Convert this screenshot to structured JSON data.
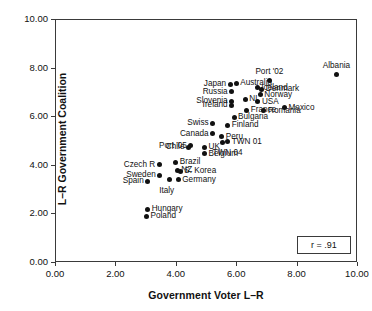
{
  "chart_data": {
    "type": "scatter",
    "title": "",
    "xlabel": "Government Voter L–R",
    "ylabel": "L–R Government Coalition",
    "xlim": [
      0.0,
      10.0
    ],
    "ylim": [
      0.0,
      10.0
    ],
    "xticks": [
      "0.00",
      "2.00",
      "4.00",
      "6.00",
      "8.00",
      "10.00"
    ],
    "yticks": [
      "0.00",
      "2.00",
      "4.00",
      "6.00",
      "8.00",
      "10.00"
    ],
    "xtick_values": [
      0,
      2,
      4,
      6,
      8,
      10
    ],
    "ytick_values": [
      0,
      2,
      4,
      6,
      8,
      10
    ],
    "grid": false,
    "legend": null,
    "annotation": "r = .91",
    "point_color": "#111111",
    "frame_color": "#3a3a3a",
    "points": [
      {
        "label": "Albania",
        "x": 9.33,
        "y": 7.7,
        "label_pos": "above"
      },
      {
        "label": "Port '02",
        "x": 7.1,
        "y": 7.45,
        "label_pos": "above"
      },
      {
        "label": "Japan",
        "x": 5.8,
        "y": 7.32,
        "label_pos": "left"
      },
      {
        "label": "Australia",
        "x": 6.0,
        "y": 7.35,
        "label_pos": "right"
      },
      {
        "label": "Iceland",
        "x": 6.7,
        "y": 7.17,
        "label_pos": "right"
      },
      {
        "label": "Denmark",
        "x": 6.85,
        "y": 7.1,
        "label_pos": "right"
      },
      {
        "label": "Russia",
        "x": 5.85,
        "y": 7.0,
        "label_pos": "left"
      },
      {
        "label": "Norway",
        "x": 6.8,
        "y": 6.88,
        "label_pos": "right"
      },
      {
        "label": "Slovenia",
        "x": 5.85,
        "y": 6.62,
        "label_pos": "left"
      },
      {
        "label": "NL",
        "x": 6.3,
        "y": 6.7,
        "label_pos": "right"
      },
      {
        "label": "USA",
        "x": 6.72,
        "y": 6.6,
        "label_pos": "right"
      },
      {
        "label": "Ireland",
        "x": 5.85,
        "y": 6.45,
        "label_pos": "left"
      },
      {
        "label": "France",
        "x": 6.35,
        "y": 6.25,
        "label_pos": "right"
      },
      {
        "label": "Mexico",
        "x": 7.6,
        "y": 6.35,
        "label_pos": "right"
      },
      {
        "label": "Romania",
        "x": 6.92,
        "y": 6.22,
        "label_pos": "right"
      },
      {
        "label": "Bulgaria",
        "x": 5.93,
        "y": 5.95,
        "label_pos": "right"
      },
      {
        "label": "Swiss",
        "x": 5.22,
        "y": 5.72,
        "label_pos": "left"
      },
      {
        "label": "Finland",
        "x": 5.72,
        "y": 5.62,
        "label_pos": "right"
      },
      {
        "label": "Canada",
        "x": 5.22,
        "y": 5.27,
        "label_pos": "left"
      },
      {
        "label": "Peru",
        "x": 5.52,
        "y": 5.15,
        "label_pos": "right"
      },
      {
        "label": "Port '05",
        "x": 4.5,
        "y": 4.78,
        "label_pos": "left"
      },
      {
        "label": "TWN 01",
        "x": 5.72,
        "y": 4.95,
        "label_pos": "right"
      },
      {
        "label": "TWN 04",
        "x": 5.55,
        "y": 4.93,
        "label_pos": "below"
      },
      {
        "label": "Chile",
        "x": 4.42,
        "y": 4.72,
        "label_pos": "left"
      },
      {
        "label": "UK",
        "x": 4.95,
        "y": 4.72,
        "label_pos": "right"
      },
      {
        "label": "Belgium",
        "x": 4.95,
        "y": 4.45,
        "label_pos": "right"
      },
      {
        "label": "Czech R",
        "x": 3.45,
        "y": 4.0,
        "label_pos": "left"
      },
      {
        "label": "Brazil",
        "x": 4.0,
        "y": 4.1,
        "label_pos": "right"
      },
      {
        "label": "Sweden",
        "x": 3.47,
        "y": 3.58,
        "label_pos": "left"
      },
      {
        "label": "NZ",
        "x": 4.05,
        "y": 3.78,
        "label_pos": "right"
      },
      {
        "label": "S. Korea",
        "x": 4.15,
        "y": 3.73,
        "label_pos": "right"
      },
      {
        "label": "Spain",
        "x": 3.07,
        "y": 3.32,
        "label_pos": "left"
      },
      {
        "label": "Italy",
        "x": 3.78,
        "y": 3.38,
        "label_pos": "below"
      },
      {
        "label": "Germany",
        "x": 4.08,
        "y": 3.38,
        "label_pos": "right"
      },
      {
        "label": "Hungary",
        "x": 3.07,
        "y": 2.18,
        "label_pos": "right"
      },
      {
        "label": "Poland",
        "x": 3.03,
        "y": 1.88,
        "label_pos": "right"
      }
    ]
  },
  "chart": {
    "x_axis_title": "Government Voter L–R",
    "y_axis_title": "L–R Government Coalition",
    "correlation_label": "r = .91"
  }
}
